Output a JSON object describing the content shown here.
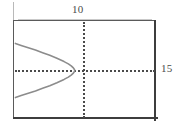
{
  "chart_data": {
    "type": "line",
    "title": "",
    "subtitle": "",
    "xlabel": "",
    "ylabel": "",
    "style": "graphing-calculator-window",
    "grid": false,
    "legend": null,
    "axes": {
      "x_axis_style": "dotted",
      "y_axis_style": "dotted",
      "x_axis_screen_row_fraction": 0.5,
      "y_axis_screen_col_fraction": 0.48
    },
    "annotations": [
      {
        "name": "x-max-label",
        "text": "10",
        "position": "top-center"
      },
      {
        "name": "y-max-label",
        "text": "15",
        "position": "right-middle"
      }
    ],
    "xlim": [
      -10,
      10
    ],
    "ylim": [
      -15,
      15
    ],
    "series": [
      {
        "name": "sideways-parabola",
        "description": "left-opening parabola, vertex right of y-axis-left region",
        "x": [
          -9.8,
          -9.0,
          -8.0,
          -7.0,
          -6.0,
          -5.0,
          -4.0,
          -3.0,
          -2.4,
          -2.0,
          -1.7,
          -1.55,
          -1.5,
          -1.55,
          -1.7,
          -2.0,
          -2.4,
          -3.0,
          -4.0,
          -5.0,
          -6.0,
          -7.0,
          -8.0,
          -9.0,
          -9.8
        ],
        "y": [
          8.2,
          7.6,
          6.9,
          6.2,
          5.4,
          4.6,
          3.7,
          2.7,
          2.0,
          1.4,
          0.8,
          0.3,
          0.0,
          -0.3,
          -0.8,
          -1.4,
          -2.0,
          -2.7,
          -3.7,
          -4.6,
          -5.4,
          -6.2,
          -6.9,
          -7.6,
          -8.2
        ],
        "color": "#8c8c8c",
        "linewidth": 1.6,
        "rendering": "pixelated/stepped"
      }
    ]
  },
  "window": {
    "frame_color": "#5a5a5a",
    "frame_accent_color": "#3d3d3d",
    "background": "#ffffff",
    "axis_color": "#4a4a4a",
    "curve_color": "#8c8c8c",
    "label_color": "#4a4a4a"
  },
  "labels": {
    "x_max": "10",
    "y_max": "15"
  }
}
